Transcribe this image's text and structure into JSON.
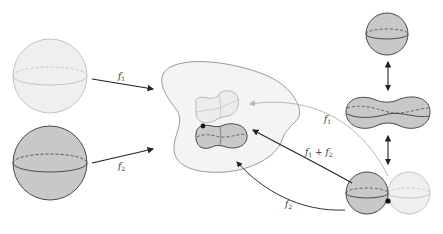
{
  "diagram": {
    "colors": {
      "light_fill": "#efefef",
      "light_stroke": "#c4c4c4",
      "dark_fill": "#c8c8c8",
      "dark_stroke": "#4a4a4a",
      "region_fill": "#f4f4f4",
      "region_stroke": "#9a9a9a",
      "arrow_dark": "#222222",
      "arrow_light": "#b8b8b8"
    },
    "labels": {
      "f1_left": {
        "base": "f",
        "sub": "1"
      },
      "f2_left": {
        "base": "f",
        "sub": "2"
      },
      "f1_right": {
        "base": "f",
        "sub": "1"
      },
      "f2_right": {
        "base": "f",
        "sub": "2"
      },
      "sum": {
        "a": "f",
        "a_sub": "1",
        "plus": " + ",
        "b": "f",
        "b_sub": "2"
      }
    },
    "nodes": [
      {
        "id": "sphere-light",
        "type": "sphere",
        "shade": "light"
      },
      {
        "id": "sphere-dark",
        "type": "sphere",
        "shade": "dark"
      },
      {
        "id": "surface-space",
        "type": "blob-region"
      },
      {
        "id": "image-f1",
        "type": "peanut",
        "shade": "light"
      },
      {
        "id": "image-f2",
        "type": "peanut",
        "shade": "dark"
      },
      {
        "id": "sphere-top-right",
        "type": "sphere",
        "shade": "dark"
      },
      {
        "id": "peanut-right",
        "type": "peanut",
        "shade": "dark"
      },
      {
        "id": "sphere-pair",
        "type": "two-spheres",
        "shades": [
          "dark",
          "light"
        ]
      }
    ],
    "edges": [
      {
        "from": "sphere-light",
        "to": "surface-space",
        "label": "f1"
      },
      {
        "from": "sphere-dark",
        "to": "surface-space",
        "label": "f2"
      },
      {
        "from": "sphere-pair",
        "to": "image-f1",
        "label": "f1"
      },
      {
        "from": "sphere-pair",
        "to": "image-f2",
        "label": "f1 + f2"
      },
      {
        "from": "sphere-pair",
        "to": "surface-space",
        "label": "f2"
      },
      {
        "from": "sphere-top-right",
        "to": "peanut-right",
        "bidirectional": true
      },
      {
        "from": "peanut-right",
        "to": "sphere-pair",
        "bidirectional": true
      }
    ]
  }
}
